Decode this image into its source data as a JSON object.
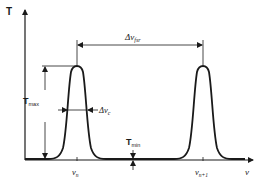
{
  "diagram": {
    "type": "fabry-perot-transmission",
    "axes": {
      "y_label": "T",
      "x_label": "ν"
    },
    "peaks": [
      {
        "label": "ν",
        "subscript": "n"
      },
      {
        "label": "ν",
        "subscript": "n+1"
      }
    ],
    "annotations": {
      "fsr": {
        "prefix": "Δν",
        "subscript": "fsr"
      },
      "linewidth": {
        "prefix": "Δν",
        "subscript": "c"
      },
      "tmax": {
        "main": "T",
        "subscript": "max"
      },
      "tmin": {
        "main": "T",
        "subscript": "min"
      }
    },
    "colors": {
      "ink": "#1a1a1a",
      "background": "#ffffff"
    }
  }
}
